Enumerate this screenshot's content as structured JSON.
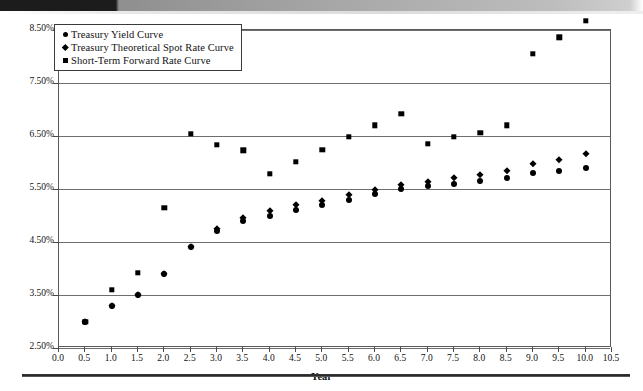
{
  "figure": {
    "axis_title_x": "Year",
    "legend_items": [
      {
        "label": "Treasury Yield Curve",
        "marker": "circle-icon"
      },
      {
        "label": "Treasury Theoretical Spot Rate Curve",
        "marker": "diamond-icon"
      },
      {
        "label": "Short-Term Forward Rate Curve",
        "marker": "square-icon"
      }
    ]
  },
  "chart_data": {
    "type": "scatter",
    "title": "",
    "xlabel": "Year",
    "ylabel": "",
    "xlim": [
      0.0,
      10.5
    ],
    "ylim": [
      2.5,
      8.5
    ],
    "grid": true,
    "legend_position": "top-left-inside",
    "x_tick_labels": [
      "0.0",
      "0.5",
      "1.0",
      "1.5",
      "2.0",
      "2.5",
      "3.0",
      "3.5",
      "4.0",
      "4.5",
      "5.0",
      "5.5",
      "6.0",
      "6.5",
      "7.0",
      "7.5",
      "8.0",
      "8.5",
      "9.0",
      "9.5",
      "10.0",
      "10.5"
    ],
    "x_ticks": [
      0.0,
      0.5,
      1.0,
      1.5,
      2.0,
      2.5,
      3.0,
      3.5,
      4.0,
      4.5,
      5.0,
      5.5,
      6.0,
      6.5,
      7.0,
      7.5,
      8.0,
      8.5,
      9.0,
      9.5,
      10.0,
      10.5
    ],
    "y_tick_labels": [
      "2.50%",
      "3.50%",
      "4.50%",
      "5.50%",
      "6.50%",
      "7.50%",
      "8.50%"
    ],
    "y_ticks": [
      2.5,
      3.5,
      4.5,
      5.5,
      6.5,
      7.5,
      8.5
    ],
    "x": [
      0.5,
      1.0,
      1.5,
      2.0,
      2.5,
      3.0,
      3.5,
      4.0,
      4.5,
      5.0,
      5.5,
      6.0,
      6.5,
      7.0,
      7.5,
      8.0,
      8.5,
      9.0,
      9.5,
      10.0
    ],
    "series": [
      {
        "name": "Treasury Yield Curve",
        "marker": "circle",
        "color": "#000000",
        "values": [
          3.0,
          3.3,
          3.5,
          3.9,
          4.4,
          4.7,
          4.9,
          5.0,
          5.1,
          5.2,
          5.3,
          5.4,
          5.5,
          5.55,
          5.6,
          5.65,
          5.7,
          5.8,
          5.85,
          5.9
        ]
      },
      {
        "name": "Treasury Theoretical Spot Rate Curve",
        "marker": "diamond",
        "color": "#000000",
        "values": [
          3.0,
          3.3,
          3.5,
          3.9,
          4.41,
          4.75,
          4.96,
          5.08,
          5.2,
          5.28,
          5.38,
          5.48,
          5.57,
          5.63,
          5.7,
          5.77,
          5.84,
          5.97,
          6.05,
          6.17
        ]
      },
      {
        "name": "Short-Term Forward Rate Curve",
        "marker": "square",
        "color": "#000000",
        "values": [
          3.0,
          3.6,
          3.92,
          5.15,
          6.54,
          6.33,
          6.23,
          5.79,
          6.01,
          6.24,
          6.48,
          6.7,
          6.92,
          6.35,
          6.49,
          6.56,
          6.7,
          8.05,
          8.36,
          8.68
        ]
      }
    ]
  }
}
